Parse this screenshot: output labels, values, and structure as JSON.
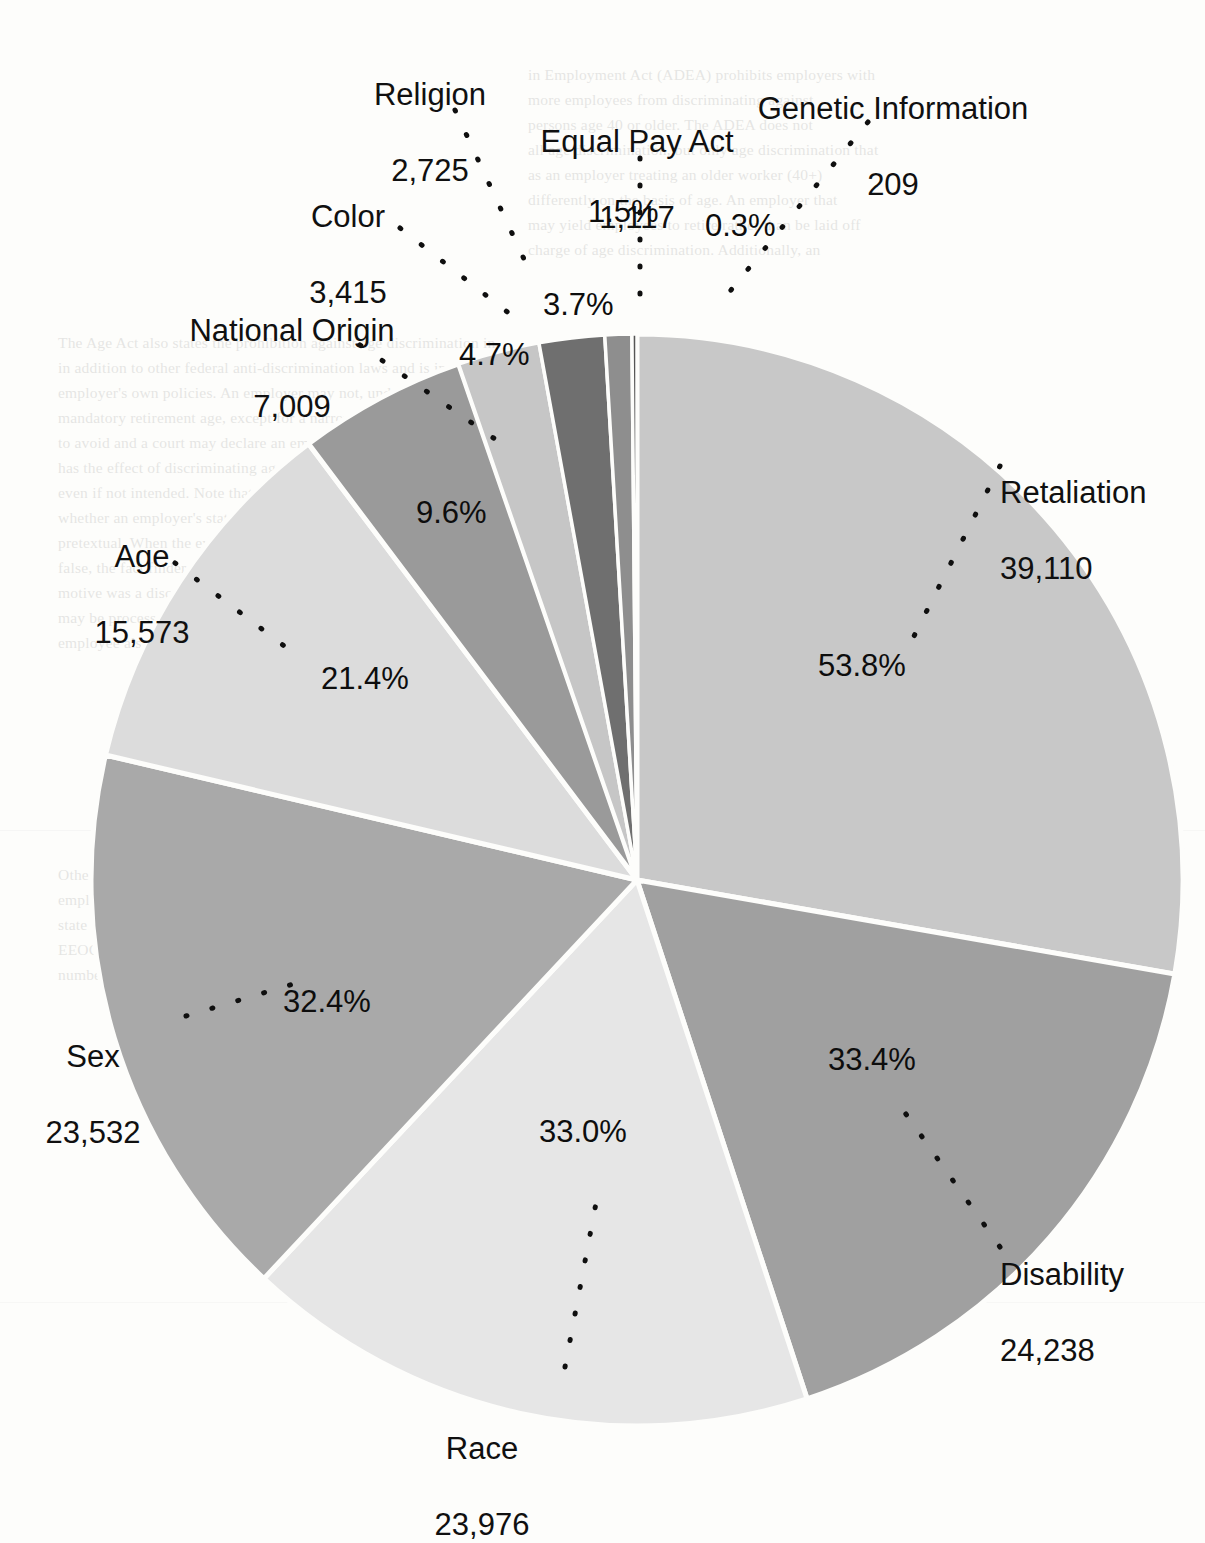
{
  "chart_data": {
    "type": "pie",
    "title": "",
    "subtitle": "",
    "xlabel": "",
    "ylabel": "",
    "legend_position": "none",
    "grid": false,
    "note": "Percentages total more than 100 because some charges allege multiple bases.",
    "categories": [
      "Retaliation",
      "Disability",
      "Race",
      "Sex",
      "Age",
      "National Origin",
      "Color",
      "Religion",
      "Equal Pay Act",
      "Genetic Information"
    ],
    "values": [
      39110,
      24238,
      23976,
      23532,
      15573,
      7009,
      3415,
      2725,
      1117,
      209
    ],
    "value_labels": [
      "39,110",
      "24,238",
      "23,976",
      "23,532",
      "15,573",
      "7,009",
      "3,415",
      "2,725",
      "1,117",
      "209"
    ],
    "percent_labels": [
      "53.8%",
      "33.4%",
      "33.0%",
      "32.4%",
      "21.4%",
      "9.6%",
      "4.7%",
      "3.7%",
      "1.5%",
      "0.3%"
    ],
    "percents": [
      53.8,
      33.4,
      33.0,
      32.4,
      21.4,
      9.6,
      4.7,
      3.7,
      1.5,
      0.3
    ],
    "slice_colors": [
      "#c8c8c8",
      "#a0a0a0",
      "#e6e6e6",
      "#a9a9a9",
      "#dcdcdc",
      "#9a9a9a",
      "#c6c6c6",
      "#6f6f6f",
      "#8e8e8e",
      "#555555"
    ],
    "slice_angles_deg": [
      144.1,
      89.5,
      88.4,
      86.8,
      57.4,
      25.8,
      12.6,
      10.0,
      4.1,
      0.8
    ],
    "start_angle_deg": 0
  },
  "labels": {
    "retaliation": {
      "name": "Retaliation",
      "value": "39,110",
      "percent": "53.8%"
    },
    "disability": {
      "name": "Disability",
      "value": "24,238",
      "percent": "33.4%"
    },
    "race": {
      "name": "Race",
      "value": "23,976",
      "percent": "33.0%"
    },
    "sex": {
      "name": "Sex",
      "value": "23,532",
      "percent": "32.4%"
    },
    "age": {
      "name": "Age",
      "value": "15,573",
      "percent": "21.4%"
    },
    "national_origin": {
      "name": "National Origin",
      "value": "7,009",
      "percent": "9.6%"
    },
    "color": {
      "name": "Color",
      "value": "3,415",
      "percent": "4.7%"
    },
    "religion": {
      "name": "Religion",
      "value": "2,725",
      "percent": "3.7%"
    },
    "equal_pay_act": {
      "name": "Equal Pay Act",
      "value": "1,117",
      "percent": "1.5%"
    },
    "genetic_information": {
      "name": "Genetic Information",
      "value": "209",
      "percent": "0.3%"
    }
  },
  "background_text": {
    "block1": [
      "in Employment Act (ADEA) prohibits employers with",
      "more employees from discriminating against",
      "persons age 40 or older. The ADEA does not",
      "all age discrimination, but only age discrimination that",
      "as an employer treating an older worker (40+)",
      "differently on the basis of age. An employer that",
      "may yield employees to retire rather than be laid off",
      "charge of age discrimination. Additionally, an"
    ],
    "block2": [
      "The Age Act also states the prohibition against age discrimination in",
      "in addition to other federal anti-discrimination laws and is in addition to",
      "employer's own policies. An employer may not, under the ADEA, require",
      "mandatory retirement age, except for a narrow class of employees.",
      "to avoid and a court may declare an employment practice unlawful if it",
      "has the effect of discriminating against older workers on the basis of age,",
      "even if not intended. Note that a court or jury may be asked to decide",
      "whether an employer's stated reason for the challenged decision is",
      "pretextual. When the evidence establishes that the stated reason is",
      "false, the fact finder may reasonably infer that the employer's true",
      "motive was a discriminatory one. A charge alleging age discrimination",
      "may be processed concurrently with a charge of retaliation if the",
      "employee also alleges that the employer retaliated against the employee."
    ],
    "block3": [
      "Other federal laws, state laws, and local ordinances may also prohibit",
      "employment discrimination. Charging parties may file with the EEOC and a",
      "state or local Fair Employment Practices Agency. Charges filed with the",
      "EEOC are often dual-filed with a state agency, and vice versa, so the total",
      "number of charges reported by the EEOC may not reflect unique filings."
    ]
  }
}
